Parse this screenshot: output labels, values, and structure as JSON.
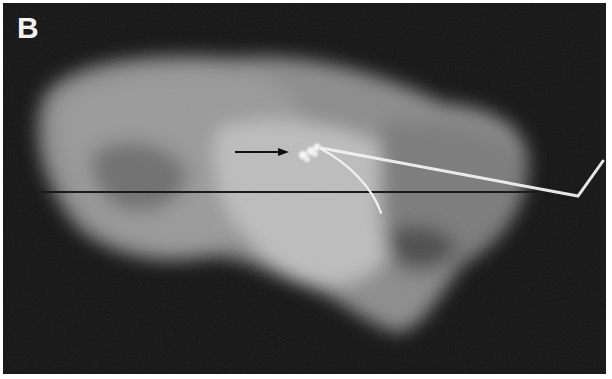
{
  "figure": {
    "panel_label": "B",
    "colors": {
      "background": "#141414",
      "tissue_light": "#bdbdbd",
      "tissue_mid": "#8a8a8a",
      "tissue_dark": "#5a5a5a",
      "wire": "#f0f0f0",
      "reference_line": "#1a1a1a",
      "arrow": "#111111",
      "label": "#f2f2f2"
    },
    "annotations": {
      "arrow": {
        "from": [
          232,
          149
        ],
        "to": [
          285,
          149
        ]
      },
      "reference_line_y": 189,
      "calcification_cluster_center": [
        305,
        150
      ]
    }
  }
}
